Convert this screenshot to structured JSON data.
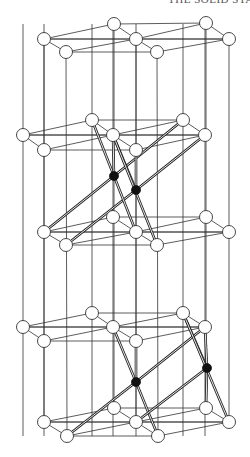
{
  "header": {
    "text": "THE SOLID STATE"
  },
  "diagram": {
    "type": "crystal-structure",
    "atom_radius": 6.5,
    "dark_radius": 4.5,
    "colors": {
      "line": "#333333",
      "atom_fill": "#ffffff",
      "dark_atom": "#111111"
    },
    "layers": [
      {
        "name": "layer-1",
        "atoms": [
          [
            114,
            24
          ],
          [
            206,
            23
          ],
          [
            44,
            39
          ],
          [
            136,
            39
          ],
          [
            229,
            39
          ],
          [
            66,
            52
          ],
          [
            157,
            52
          ]
        ]
      },
      {
        "name": "layer-2",
        "atoms": [
          [
            92,
            120
          ],
          [
            183,
            120
          ],
          [
            23,
            135
          ],
          [
            113,
            135
          ],
          [
            205,
            135
          ],
          [
            44,
            150
          ],
          [
            136,
            150
          ]
        ]
      },
      {
        "name": "layer-3",
        "atoms": [
          [
            113,
            217
          ],
          [
            206,
            217
          ],
          [
            44,
            232
          ],
          [
            136,
            232
          ],
          [
            229,
            232
          ],
          [
            66,
            245
          ],
          [
            157,
            245
          ]
        ]
      },
      {
        "name": "layer-4",
        "atoms": [
          [
            92,
            313
          ],
          [
            183,
            313
          ],
          [
            23,
            327
          ],
          [
            113,
            327
          ],
          [
            205,
            327
          ],
          [
            44,
            341
          ],
          [
            136,
            341
          ]
        ]
      },
      {
        "name": "layer-5",
        "atoms": [
          [
            114,
            408
          ],
          [
            206,
            408
          ],
          [
            44,
            422
          ],
          [
            136,
            422
          ],
          [
            229,
            422
          ],
          [
            67,
            436
          ],
          [
            158,
            436
          ]
        ]
      }
    ],
    "vertical_lines_x": [
      44,
      66,
      114,
      136,
      157,
      206,
      229
    ],
    "vertical_line_range": [
      24,
      436
    ],
    "dark_atoms": [
      [
        114,
        176
      ],
      [
        136,
        190
      ],
      [
        136,
        382
      ],
      [
        207,
        368
      ]
    ],
    "bonds": [
      [
        [
          92,
          120
        ],
        [
          114,
          176
        ]
      ],
      [
        [
          113,
          135
        ],
        [
          114,
          176
        ]
      ],
      [
        [
          183,
          120
        ],
        [
          114,
          176
        ]
      ],
      [
        [
          44,
          232
        ],
        [
          114,
          176
        ]
      ],
      [
        [
          113,
          135
        ],
        [
          136,
          190
        ]
      ],
      [
        [
          136,
          150
        ],
        [
          136,
          190
        ]
      ],
      [
        [
          205,
          135
        ],
        [
          136,
          190
        ]
      ],
      [
        [
          66,
          245
        ],
        [
          136,
          190
        ]
      ],
      [
        [
          113,
          135
        ],
        [
          157,
          245
        ]
      ],
      [
        [
          114,
          176
        ],
        [
          136,
          232
        ]
      ],
      [
        [
          113,
          327
        ],
        [
          136,
          382
        ]
      ],
      [
        [
          136,
          341
        ],
        [
          136,
          382
        ]
      ],
      [
        [
          205,
          327
        ],
        [
          136,
          382
        ]
      ],
      [
        [
          67,
          436
        ],
        [
          136,
          382
        ]
      ],
      [
        [
          136,
          382
        ],
        [
          158,
          436
        ]
      ],
      [
        [
          183,
          313
        ],
        [
          207,
          368
        ]
      ],
      [
        [
          205,
          327
        ],
        [
          207,
          368
        ]
      ],
      [
        [
          207,
          368
        ],
        [
          206,
          408
        ]
      ],
      [
        [
          207,
          368
        ],
        [
          136,
          422
        ]
      ],
      [
        [
          183,
          313
        ],
        [
          229,
          422
        ]
      ]
    ]
  }
}
